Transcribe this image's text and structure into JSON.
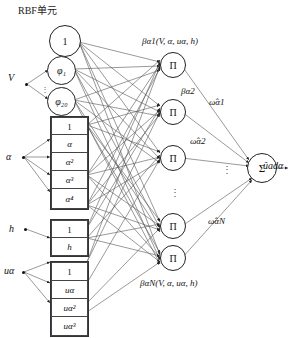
{
  "diagram": {
    "title": "RBF单元",
    "type": "neural-network-architecture",
    "inputs": [
      {
        "id": "V",
        "label": "V",
        "x": 10,
        "y": 74
      },
      {
        "id": "alpha",
        "label": "α",
        "x": 8,
        "y": 155
      },
      {
        "id": "h",
        "label": "h",
        "x": 10,
        "y": 228
      },
      {
        "id": "ua",
        "label": "uα",
        "x": 5,
        "y": 270
      }
    ],
    "rbf_layer": {
      "bias_node": "1",
      "phi_first": "φ₁",
      "phi_last": "φ₂₀",
      "vertical_dots": "⋮"
    },
    "regressor_groups": [
      {
        "name": "alpha-group",
        "cells": [
          "1",
          "α",
          "α²",
          "α³",
          "α⁴"
        ]
      },
      {
        "name": "h-group",
        "cells": [
          "1",
          "h"
        ]
      },
      {
        "name": "ua-group",
        "cells": [
          "1",
          "uα",
          "uα²",
          "uα³"
        ]
      }
    ],
    "product_nodes": {
      "symbol": "Π",
      "count_shown": 5,
      "ellipsis": "⋮"
    },
    "sum_node": {
      "symbol": "Σ"
    },
    "beta_labels": {
      "first": "βα1(V, α, uα, h)",
      "second": "βα2",
      "last": "βαN(V, α, uα, h)"
    },
    "weight_labels": {
      "w1": "ω̂α1",
      "w2": "ω̂α2",
      "wN": "ω̂αN",
      "dots": "⋮"
    },
    "output": {
      "label": "ûadα"
    },
    "colors": {
      "stroke": "#444444",
      "node_stroke": "#222222",
      "text": "#111111",
      "background": "#ffffff"
    }
  }
}
